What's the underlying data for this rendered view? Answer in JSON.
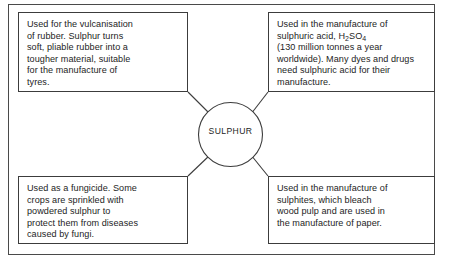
{
  "diagram": {
    "type": "spider-concept-map",
    "centre": {
      "label": "SULPHUR"
    },
    "branches": [
      {
        "id": "vulcanisation",
        "position": "top-left",
        "text": "Used for the vulcanisation\nof rubber. Sulphur turns\nsoft, pliable rubber into a\ntougher material, suitable\nfor the manufacture of\ntyres."
      },
      {
        "id": "sulphuric-acid",
        "position": "top-right",
        "text_before_formula": "Used in the manufacture of\nsulphuric acid, H",
        "formula_sub_1": "2",
        "formula_mid": "SO",
        "formula_sub_2": "4",
        "text_after_formula": "\n(130 million tonnes a year\nworldwide). Many dyes and drugs\nneed sulphuric acid for their\nmanufacture."
      },
      {
        "id": "fungicide",
        "position": "bottom-left",
        "text": "Used as a fungicide. Some\ncrops are sprinkled with\npowdered sulphur to\nprotect them from diseases\ncaused by fungi."
      },
      {
        "id": "sulphites",
        "position": "bottom-right",
        "text": "Used in the manufacture of\nsulphites, which bleach\nwood pulp and are used in\nthe manufacture of paper."
      }
    ],
    "colors": {
      "line": "#3c3c3c",
      "frame": "#4a4a4a",
      "text": "#1d1d1d",
      "background": "#ffffff"
    }
  }
}
